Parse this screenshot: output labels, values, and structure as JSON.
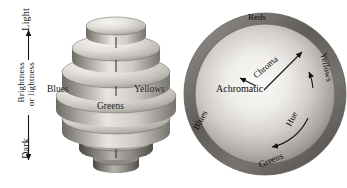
{
  "figure": {
    "background_color": "#ffffff",
    "ink_color": "#141414"
  },
  "brightness_axis": {
    "top_label": "Light",
    "bottom_label": "Dark",
    "name_line_1": "Brightness",
    "name_line_2": "or lightness",
    "arrow_style": "double-headed-vertical"
  },
  "color_solid": {
    "description": "Stack of elliptical discs forming a color solid",
    "labels": {
      "blues": "Blues",
      "yellows": "Yellows",
      "greens": "Greens"
    },
    "disc_count": 7,
    "shading": {
      "highlight": "#f2f0ec",
      "midtone": "#b8b4ae",
      "shadow": "#5d5a56"
    }
  },
  "hue_circle": {
    "center_label": "Achromatic",
    "radial_label": "Chroma",
    "arc_label": "Hue",
    "rim_labels": {
      "top": "Reds",
      "right": "Yellows",
      "bottom": "Greens",
      "left": "Blues"
    },
    "shading": {
      "rim": "#6b6864",
      "inner_highlight": "#f6f4f0",
      "inner_edge": "#8e8b86"
    }
  }
}
